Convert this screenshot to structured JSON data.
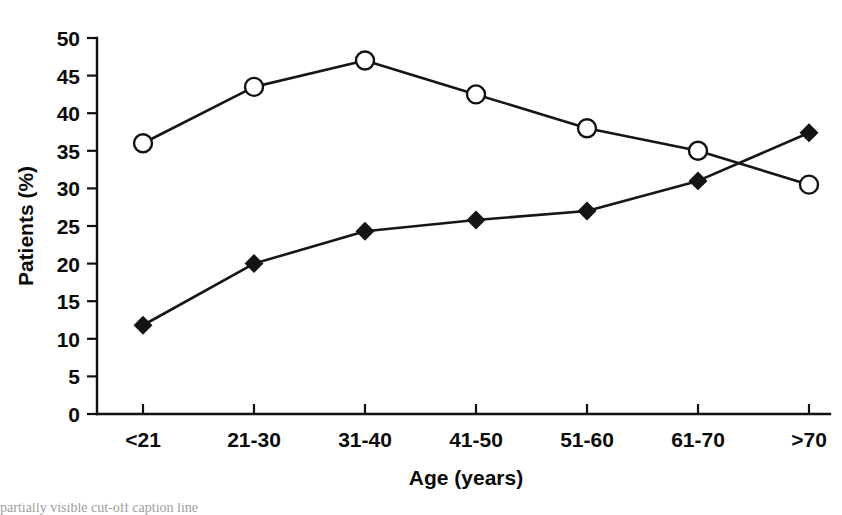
{
  "chart_data": {
    "type": "line",
    "title": "",
    "subtitle": "",
    "xlabel": "Age (years)",
    "ylabel": "Patients (%)",
    "categories": [
      "<21",
      "21-30",
      "31-40",
      "41-50",
      "51-60",
      "61-70",
      ">70"
    ],
    "ylim": [
      0,
      50
    ],
    "yticks": [
      0,
      5,
      10,
      15,
      20,
      25,
      30,
      35,
      40,
      45,
      50
    ],
    "ytick_labels": [
      "0",
      "5",
      "10",
      "15",
      "20",
      "25",
      "30",
      "35",
      "40",
      "45",
      "50"
    ],
    "grid": false,
    "legend": "none",
    "series": [
      {
        "name": "open-circle-series",
        "marker": "open-circle",
        "values": [
          36.0,
          43.5,
          47.0,
          42.5,
          38.0,
          35.0,
          30.5
        ]
      },
      {
        "name": "filled-diamond-series",
        "marker": "filled-diamond",
        "values": [
          11.8,
          20.0,
          24.3,
          25.8,
          27.0,
          31.0,
          37.4
        ]
      }
    ]
  },
  "caption": {
    "text": "partially visible cut-off caption line"
  }
}
